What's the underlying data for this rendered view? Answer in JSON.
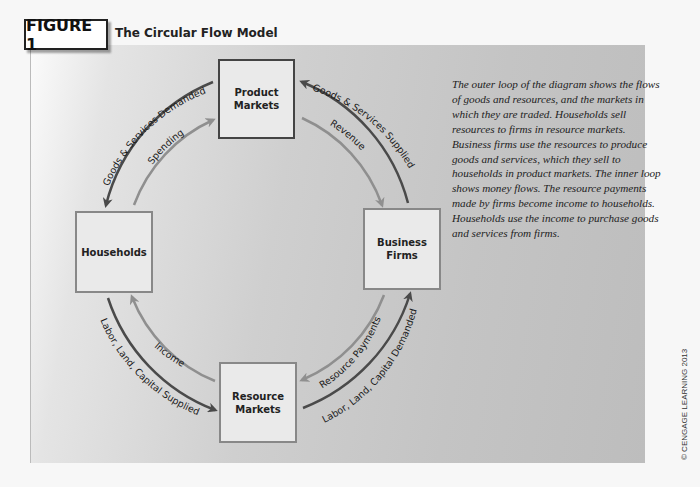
{
  "figure": {
    "tag": "FIGURE 1",
    "title": "The Circular Flow Model"
  },
  "nodes": {
    "product_markets": [
      "Product",
      "Markets"
    ],
    "households": [
      "Households"
    ],
    "business_firms": [
      "Business",
      "Firms"
    ],
    "resource_markets": [
      "Resource",
      "Markets"
    ]
  },
  "flows": {
    "outer": {
      "goods_services_demanded": "Goods & Services Demanded",
      "goods_services_supplied": "Goods & Services Supplied",
      "labor_supplied": "Labor, Land, Capital Supplied",
      "labor_demanded": "Labor, Land, Capital Demanded"
    },
    "inner": {
      "spending": "Spending",
      "revenue": "Revenue",
      "income": "Income",
      "resource_payments": "Resource Payments"
    }
  },
  "colors": {
    "outer_arrow": "#4a4a4a",
    "inner_arrow": "#8f8f8f"
  },
  "caption": "The outer loop of the diagram shows the flows of goods and resources, and the markets in which they are traded. Households sell resources to firms in resource markets. Business firms use the resources to produce goods and services, which they sell to households in product markets. The inner loop shows money flows. The resource payments made by firms become income to households. Households use the income to purchase goods and services from firms.",
  "copyright": "© CENGAGE LEARNING 2013"
}
